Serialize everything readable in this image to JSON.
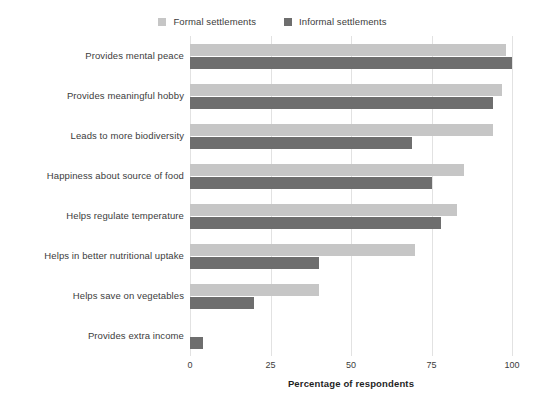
{
  "chart_data": {
    "type": "bar",
    "orientation": "horizontal",
    "title": "",
    "xlabel": "Percentage of respondents",
    "ylabel": "",
    "xlim": [
      0,
      100
    ],
    "xticks": [
      0,
      25,
      50,
      75,
      100
    ],
    "grid": true,
    "legend_position": "top-center",
    "categories": [
      "Provides mental peace",
      "Provides meaningful hobby",
      "Leads to more biodiversity",
      "Happiness about source of food",
      "Helps regulate temperature",
      "Helps in better nutritional uptake",
      "Helps save on vegetables",
      "Provides extra income"
    ],
    "series": [
      {
        "name": "Formal settlements",
        "color": "#c6c6c6",
        "values": [
          98,
          97,
          94,
          85,
          83,
          70,
          40,
          0
        ]
      },
      {
        "name": "Informal settlements",
        "color": "#6e6e6e",
        "values": [
          100,
          94,
          69,
          75,
          78,
          40,
          20,
          4
        ]
      }
    ]
  },
  "axis": {
    "tick_labels": [
      "0",
      "25",
      "50",
      "75",
      "100"
    ],
    "x_title": "Percentage of respondents"
  },
  "legend": {
    "items": [
      {
        "label": "Formal settlements",
        "color": "#c6c6c6"
      },
      {
        "label": "Informal settlements",
        "color": "#6e6e6e"
      }
    ]
  },
  "colors": {
    "formal": "#c6c6c6",
    "informal": "#6e6e6e",
    "gridline": "#e2e2e2",
    "text": "#3c3c3c",
    "background": "#ffffff"
  }
}
